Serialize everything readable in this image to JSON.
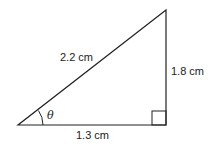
{
  "diagram": {
    "type": "right-triangle",
    "hypotenuse_label": "2.2 cm",
    "opposite_label": "1.8 cm",
    "adjacent_label": "1.3 cm",
    "angle_label": "θ",
    "right_angle_marker": true,
    "stroke_color": "#222222"
  }
}
